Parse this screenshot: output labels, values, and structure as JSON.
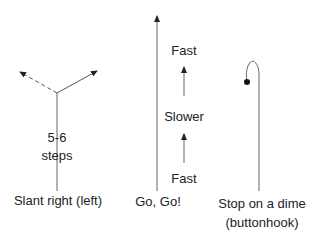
{
  "routes": [
    {
      "name": "Slant right (left)",
      "annotation_lines": [
        "5-6",
        "steps"
      ],
      "label": "Slant right (left)"
    },
    {
      "name": "Go, Go!",
      "speed_labels": [
        "Fast",
        "Slower",
        "Fast"
      ],
      "label": "Go, Go!"
    },
    {
      "name": "Stop on a dime",
      "label_lines": [
        "Stop on a dime",
        "(buttonhook)"
      ]
    }
  ],
  "colors": {
    "line": "#555555",
    "text": "#222222"
  }
}
